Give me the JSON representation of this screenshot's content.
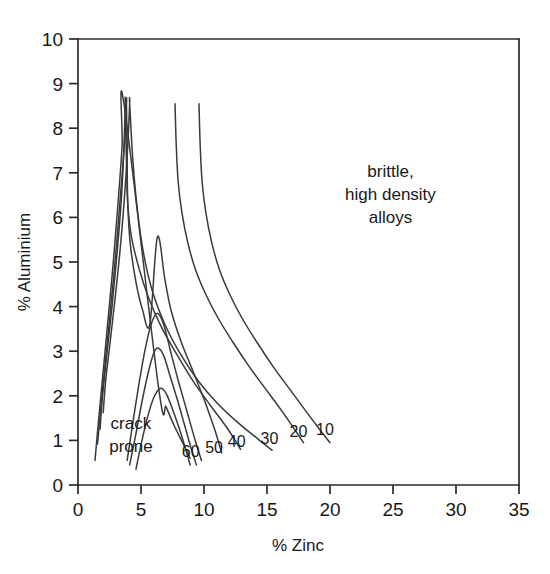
{
  "chart_data": {
    "type": "line",
    "title": "",
    "xlabel": "% Zinc",
    "ylabel": "% Aluminium",
    "xlim": [
      0,
      35
    ],
    "ylim": [
      0,
      10
    ],
    "xticks": [
      "0",
      "5",
      "10",
      "15",
      "20",
      "25",
      "30",
      "35"
    ],
    "yticks": [
      "0",
      "1",
      "2",
      "3",
      "4",
      "5",
      "6",
      "7",
      "8",
      "9",
      "10"
    ],
    "xtick_values": [
      0,
      5,
      10,
      15,
      20,
      25,
      30,
      35
    ],
    "ytick_values": [
      0,
      1,
      2,
      3,
      4,
      5,
      6,
      7,
      8,
      9,
      10
    ],
    "grid": false,
    "legend": "none",
    "annotations": [
      {
        "name": "crack-prone",
        "lines": [
          "crack",
          "prone"
        ],
        "x": 4.2,
        "y": 1.25
      },
      {
        "name": "brittle-high-density-alloys",
        "lines": [
          "brittle,",
          "high density",
          "alloys"
        ],
        "x": 24.8,
        "y": 6.9
      }
    ],
    "series": [
      {
        "name": "10",
        "label": "10",
        "label_x": 19.6,
        "label_y": 1.12,
        "points": [
          [
            9.6,
            8.55
          ],
          [
            9.7,
            7.6
          ],
          [
            9.85,
            6.8
          ],
          [
            10.15,
            6.1
          ],
          [
            10.6,
            5.45
          ],
          [
            11.2,
            4.85
          ],
          [
            12.0,
            4.3
          ],
          [
            13.0,
            3.75
          ],
          [
            14.2,
            3.2
          ],
          [
            15.5,
            2.65
          ],
          [
            16.8,
            2.15
          ],
          [
            18.1,
            1.65
          ],
          [
            19.3,
            1.2
          ],
          [
            20.0,
            0.95
          ]
        ]
      },
      {
        "name": "20",
        "label": "20",
        "label_x": 17.5,
        "label_y": 1.08,
        "points": [
          [
            7.7,
            8.55
          ],
          [
            7.8,
            7.6
          ],
          [
            7.95,
            6.8
          ],
          [
            8.25,
            6.1
          ],
          [
            8.7,
            5.45
          ],
          [
            9.3,
            4.85
          ],
          [
            10.1,
            4.3
          ],
          [
            11.1,
            3.75
          ],
          [
            12.3,
            3.2
          ],
          [
            13.6,
            2.65
          ],
          [
            14.9,
            2.15
          ],
          [
            16.2,
            1.65
          ],
          [
            17.3,
            1.2
          ],
          [
            17.9,
            0.95
          ]
        ]
      },
      {
        "name": "30",
        "label": "30",
        "label_x": 15.2,
        "label_y": 0.92,
        "points": [
          [
            2.0,
            1.62
          ],
          [
            2.2,
            2.35
          ],
          [
            2.55,
            3.2
          ],
          [
            2.95,
            4.2
          ],
          [
            3.35,
            5.3
          ],
          [
            3.7,
            6.5
          ],
          [
            3.95,
            7.6
          ],
          [
            4.1,
            8.55
          ],
          [
            4.1,
            8.55
          ],
          [
            4.35,
            7.3
          ],
          [
            4.7,
            6.2
          ],
          [
            5.2,
            5.2
          ],
          [
            5.9,
            4.35
          ],
          [
            6.9,
            3.6
          ],
          [
            8.1,
            2.95
          ],
          [
            9.5,
            2.35
          ],
          [
            11.0,
            1.85
          ],
          [
            12.6,
            1.42
          ],
          [
            14.2,
            1.05
          ],
          [
            15.4,
            0.78
          ]
        ]
      },
      {
        "name": "40",
        "label": "40",
        "label_x": 12.6,
        "label_y": 0.85,
        "points": [
          [
            1.75,
            1.25
          ],
          [
            1.95,
            2.0
          ],
          [
            2.3,
            2.95
          ],
          [
            2.7,
            4.0
          ],
          [
            3.1,
            5.2
          ],
          [
            3.45,
            6.45
          ],
          [
            3.65,
            7.6
          ],
          [
            3.75,
            8.55
          ],
          [
            3.75,
            8.55
          ],
          [
            3.85,
            7.2
          ],
          [
            3.95,
            6.3
          ],
          [
            4.25,
            5.55
          ],
          [
            4.85,
            4.85
          ],
          [
            5.6,
            4.2
          ],
          [
            6.6,
            3.55
          ],
          [
            7.9,
            2.9
          ],
          [
            9.2,
            2.3
          ],
          [
            10.6,
            1.75
          ],
          [
            11.9,
            1.25
          ],
          [
            12.9,
            0.8
          ]
        ]
      },
      {
        "name": "50",
        "label": "50",
        "label_x": 10.8,
        "label_y": 0.72,
        "points": [
          [
            1.55,
            0.92
          ],
          [
            1.8,
            1.7
          ],
          [
            2.15,
            2.7
          ],
          [
            2.55,
            3.85
          ],
          [
            3.0,
            5.2
          ],
          [
            3.4,
            6.6
          ],
          [
            3.7,
            7.7
          ],
          [
            3.85,
            8.55
          ],
          [
            3.85,
            8.55
          ],
          [
            3.9,
            7.3
          ],
          [
            3.95,
            6.3
          ],
          [
            4.15,
            5.4
          ],
          [
            4.6,
            4.55
          ],
          [
            5.1,
            3.95
          ],
          [
            5.7,
            3.6
          ],
          [
            6.3,
            5.56
          ],
          [
            6.9,
            4.6
          ],
          [
            7.4,
            3.9
          ],
          [
            8.2,
            3.2
          ],
          [
            9.2,
            2.5
          ],
          [
            10.1,
            1.85
          ],
          [
            10.9,
            1.2
          ],
          [
            11.4,
            0.72
          ]
        ]
      },
      {
        "name": "60",
        "label": "60",
        "label_x": 8.95,
        "label_y": 0.62,
        "points": [
          [
            1.35,
            0.55
          ],
          [
            1.6,
            1.35
          ],
          [
            1.95,
            2.4
          ],
          [
            2.35,
            3.6
          ],
          [
            2.8,
            5.0
          ],
          [
            3.2,
            6.4
          ],
          [
            3.5,
            7.6
          ],
          [
            3.65,
            8.55
          ],
          [
            6.4,
            2.17
          ],
          [
            7.0,
            1.75
          ],
          [
            7.6,
            1.35
          ],
          [
            8.3,
            0.95
          ],
          [
            8.9,
            0.6
          ]
        ]
      }
    ],
    "inner_arches": [
      {
        "name": "arch-3.85",
        "peak_x": 6.3,
        "peak_y": 3.85,
        "points": [
          [
            3.9,
            0.55
          ],
          [
            4.3,
            1.3
          ],
          [
            4.8,
            2.2
          ],
          [
            5.3,
            3.0
          ],
          [
            5.8,
            3.6
          ],
          [
            6.3,
            3.85
          ],
          [
            6.8,
            3.6
          ],
          [
            7.3,
            3.05
          ],
          [
            7.9,
            2.4
          ],
          [
            8.6,
            1.7
          ],
          [
            9.3,
            1.0
          ],
          [
            9.8,
            0.55
          ]
        ]
      },
      {
        "name": "arch-3.07",
        "peak_x": 6.35,
        "peak_y": 3.07,
        "points": [
          [
            4.1,
            0.45
          ],
          [
            4.6,
            1.15
          ],
          [
            5.1,
            1.9
          ],
          [
            5.6,
            2.55
          ],
          [
            6.0,
            2.95
          ],
          [
            6.35,
            3.07
          ],
          [
            6.8,
            2.9
          ],
          [
            7.3,
            2.45
          ],
          [
            7.9,
            1.9
          ],
          [
            8.5,
            1.3
          ],
          [
            9.0,
            0.8
          ],
          [
            9.4,
            0.45
          ]
        ]
      },
      {
        "name": "arch-2.17",
        "peak_x": 6.55,
        "peak_y": 2.17,
        "points": [
          [
            4.6,
            0.35
          ],
          [
            5.0,
            0.9
          ],
          [
            5.5,
            1.5
          ],
          [
            6.0,
            1.95
          ],
          [
            6.55,
            2.17
          ],
          [
            7.0,
            2.05
          ],
          [
            7.5,
            1.7
          ],
          [
            8.0,
            1.3
          ],
          [
            8.5,
            0.85
          ],
          [
            8.9,
            0.45
          ]
        ]
      }
    ]
  },
  "axes": {
    "x_title": "% Zinc",
    "y_title": "% Aluminium"
  },
  "colors": {
    "curve": "#3a3a3a",
    "axis": "#2b2b2b",
    "text": "#181818",
    "background": "#ffffff"
  }
}
